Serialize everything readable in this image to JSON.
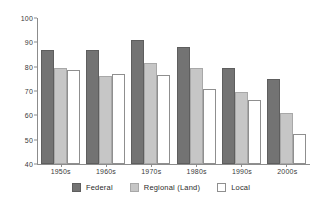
{
  "chart_data": {
    "type": "bar",
    "title": "",
    "subtitle": "",
    "xlabel": "",
    "ylabel": "",
    "categories": [
      "1950s",
      "1960s",
      "1970s",
      "1980s",
      "1990s",
      "2000s"
    ],
    "series": [
      {
        "name": "Federal",
        "color": "#737373",
        "values": [
          87,
          87,
          91,
          88,
          79.5,
          75
        ]
      },
      {
        "name": "Regional (Land)",
        "color": "#c6c6c6",
        "values": [
          79.5,
          76,
          81.5,
          79.5,
          69.5,
          61
        ]
      },
      {
        "name": "Local",
        "color": "#ffffff",
        "values": [
          78.5,
          77,
          76.5,
          71,
          66.5,
          52.5
        ]
      }
    ],
    "ylim": [
      40,
      100
    ],
    "yticks": [
      40,
      50,
      60,
      70,
      80,
      90,
      100
    ],
    "ytick_labels": [
      "40",
      "50",
      "60",
      "70",
      "80",
      "90",
      "100"
    ],
    "grid": false,
    "legend_position": "bottom"
  },
  "legend": {
    "items": [
      {
        "label": "Federal",
        "swatch": "federal"
      },
      {
        "label": "Regional (Land)",
        "swatch": "regional"
      },
      {
        "label": "Local",
        "swatch": "local"
      }
    ]
  }
}
